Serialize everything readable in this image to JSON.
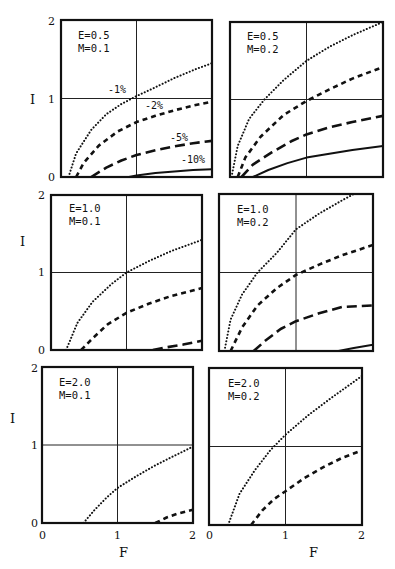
{
  "chart_data": [
    {
      "type": "line",
      "panel": "top-left",
      "annotation": [
        "E=0.5",
        "M=0.1"
      ],
      "xlabel": "",
      "ylabel": "I",
      "xlim": [
        0,
        2
      ],
      "ylim": [
        0,
        2
      ],
      "grid_lines": {
        "x": [
          1
        ],
        "y": [
          1
        ]
      },
      "yticks": [
        "0",
        "1",
        "2"
      ],
      "series": [
        {
          "name": "-1%",
          "style": "dotted",
          "x": [
            0.1,
            0.2,
            0.4,
            0.6,
            0.8,
            1.0,
            1.2,
            1.5,
            1.8,
            2.0
          ],
          "y": [
            0,
            0.3,
            0.6,
            0.8,
            0.93,
            1.03,
            1.12,
            1.26,
            1.38,
            1.45
          ]
        },
        {
          "name": "-2%",
          "style": "short-dash",
          "x": [
            0.2,
            0.3,
            0.5,
            0.75,
            1.0,
            1.25,
            1.5,
            1.75,
            2.0
          ],
          "y": [
            0,
            0.18,
            0.4,
            0.58,
            0.7,
            0.78,
            0.85,
            0.91,
            0.96
          ]
        },
        {
          "name": "-5%",
          "style": "long-dash",
          "x": [
            0.4,
            0.6,
            0.8,
            1.0,
            1.25,
            1.5,
            1.75,
            2.0
          ],
          "y": [
            0,
            0.12,
            0.21,
            0.28,
            0.34,
            0.39,
            0.43,
            0.46
          ]
        },
        {
          "name": "-10%",
          "style": "solid",
          "x": [
            0.9,
            1.0,
            1.25,
            1.5,
            1.75,
            2.0
          ],
          "y": [
            0,
            0.02,
            0.05,
            0.07,
            0.09,
            0.1
          ]
        }
      ],
      "curve_labels": [
        {
          "text": "-1%",
          "x": 0.72,
          "y": 1.08
        },
        {
          "text": "-2%",
          "x": 1.28,
          "y": 0.88
        },
        {
          "text": "-5%",
          "x": 1.52,
          "y": 0.52
        },
        {
          "text": "-10%",
          "x": 1.62,
          "y": 0.2
        }
      ]
    },
    {
      "type": "line",
      "panel": "top-right",
      "annotation": [
        "E=0.5",
        "M=0.2"
      ],
      "xlabel": "",
      "ylabel": "",
      "xlim": [
        0,
        2
      ],
      "ylim": [
        0,
        2
      ],
      "grid_lines": {
        "x": [
          1
        ],
        "y": [
          1
        ]
      },
      "series": [
        {
          "name": "-1%",
          "style": "dotted",
          "x": [
            0.02,
            0.1,
            0.25,
            0.45,
            0.7,
            1.0,
            1.3,
            1.6,
            2.0
          ],
          "y": [
            0,
            0.4,
            0.75,
            1.0,
            1.25,
            1.5,
            1.68,
            1.83,
            2.0
          ]
        },
        {
          "name": "-2%",
          "style": "short-dash",
          "x": [
            0.1,
            0.2,
            0.4,
            0.7,
            1.0,
            1.3,
            1.6,
            2.0
          ],
          "y": [
            0,
            0.25,
            0.52,
            0.8,
            0.98,
            1.13,
            1.27,
            1.42
          ]
        },
        {
          "name": "-5%",
          "style": "long-dash",
          "x": [
            0.15,
            0.3,
            0.55,
            0.8,
            1.0,
            1.3,
            1.6,
            2.0
          ],
          "y": [
            0,
            0.16,
            0.32,
            0.46,
            0.55,
            0.64,
            0.71,
            0.79
          ]
        },
        {
          "name": "-10%",
          "style": "solid",
          "x": [
            0.3,
            0.5,
            0.75,
            1.0,
            1.3,
            1.6,
            2.0
          ],
          "y": [
            0,
            0.09,
            0.18,
            0.25,
            0.3,
            0.35,
            0.4
          ]
        }
      ]
    },
    {
      "type": "line",
      "panel": "middle-left",
      "annotation": [
        "E=1.0",
        "M=0.1"
      ],
      "xlabel": "",
      "ylabel": "I",
      "xlim": [
        0,
        2
      ],
      "ylim": [
        0,
        2
      ],
      "grid_lines": {
        "x": [
          1
        ],
        "y": [
          1
        ]
      },
      "yticks": [
        "0",
        "1",
        "2"
      ],
      "series": [
        {
          "name": "-1%",
          "style": "dotted",
          "x": [
            0.2,
            0.35,
            0.55,
            0.8,
            1.0,
            1.3,
            1.6,
            2.0
          ],
          "y": [
            0,
            0.35,
            0.62,
            0.85,
            1.0,
            1.15,
            1.28,
            1.42
          ]
        },
        {
          "name": "-2%",
          "style": "short-dash",
          "x": [
            0.4,
            0.55,
            0.75,
            1.0,
            1.3,
            1.6,
            2.0
          ],
          "y": [
            0,
            0.15,
            0.33,
            0.48,
            0.6,
            0.7,
            0.8
          ]
        },
        {
          "name": "-5%",
          "style": "long-dash",
          "x": [
            1.35,
            1.5,
            1.75,
            2.0
          ],
          "y": [
            0,
            0.03,
            0.07,
            0.12
          ]
        }
      ]
    },
    {
      "type": "line",
      "panel": "middle-right",
      "annotation": [
        "E=1.0",
        "M=0.2"
      ],
      "xlabel": "",
      "ylabel": "",
      "xlim": [
        0,
        2
      ],
      "ylim": [
        0,
        2
      ],
      "grid_lines": {
        "x": [
          1
        ],
        "y": [
          1
        ]
      },
      "series": [
        {
          "name": "-1%",
          "style": "dotted",
          "x": [
            0.07,
            0.15,
            0.3,
            0.5,
            0.75,
            1.0,
            1.3,
            1.6,
            1.75
          ],
          "y": [
            0,
            0.4,
            0.72,
            1.0,
            1.25,
            1.55,
            1.75,
            1.92,
            2.0
          ]
        },
        {
          "name": "-2%",
          "style": "short-dash",
          "x": [
            0.15,
            0.3,
            0.5,
            0.75,
            1.0,
            1.3,
            1.6,
            2.0
          ],
          "y": [
            0,
            0.3,
            0.58,
            0.8,
            0.97,
            1.1,
            1.22,
            1.35
          ]
        },
        {
          "name": "-5%",
          "style": "long-dash",
          "x": [
            0.45,
            0.6,
            0.8,
            1.0,
            1.3,
            1.6,
            2.0
          ],
          "y": [
            0,
            0.13,
            0.28,
            0.38,
            0.48,
            0.56,
            0.58
          ]
        },
        {
          "name": "-10%",
          "style": "solid",
          "x": [
            1.55,
            1.75,
            2.0
          ],
          "y": [
            0,
            0.04,
            0.08
          ]
        }
      ]
    },
    {
      "type": "line",
      "panel": "bottom-left",
      "annotation": [
        "E=2.0",
        "M=0.1"
      ],
      "xlabel": "F",
      "ylabel": "I",
      "xlim": [
        0,
        2
      ],
      "ylim": [
        0,
        2
      ],
      "grid_lines": {
        "x": [
          1
        ],
        "y": [
          1
        ]
      },
      "xticks": [
        "0",
        "1",
        "2"
      ],
      "yticks": [
        "0",
        "1",
        "2"
      ],
      "series": [
        {
          "name": "-1%",
          "style": "dotted",
          "x": [
            0.55,
            0.7,
            0.85,
            1.0,
            1.25,
            1.5,
            1.75,
            2.0
          ],
          "y": [
            0,
            0.17,
            0.32,
            0.45,
            0.6,
            0.74,
            0.86,
            0.98
          ]
        },
        {
          "name": "-2%",
          "style": "short-dash",
          "x": [
            1.5,
            1.65,
            1.8,
            2.0
          ],
          "y": [
            0,
            0.07,
            0.12,
            0.17
          ]
        }
      ]
    },
    {
      "type": "line",
      "panel": "bottom-right",
      "annotation": [
        "E=2.0",
        "M=0.2"
      ],
      "xlabel": "F",
      "ylabel": "",
      "xlim": [
        0,
        2
      ],
      "ylim": [
        0,
        2
      ],
      "grid_lines": {
        "x": [
          1
        ],
        "y": [
          1
        ]
      },
      "xticks": [
        "0",
        "1",
        "2"
      ],
      "series": [
        {
          "name": "-1%",
          "style": "dotted",
          "x": [
            0.25,
            0.4,
            0.6,
            0.8,
            1.0,
            1.3,
            1.6,
            2.0
          ],
          "y": [
            0,
            0.4,
            0.7,
            0.95,
            1.15,
            1.4,
            1.62,
            1.9
          ]
        },
        {
          "name": "-2%",
          "style": "short-dash",
          "x": [
            0.55,
            0.7,
            0.85,
            1.0,
            1.25,
            1.5,
            1.75,
            2.0
          ],
          "y": [
            0,
            0.19,
            0.33,
            0.43,
            0.6,
            0.74,
            0.86,
            0.95
          ]
        }
      ]
    }
  ],
  "axis": {
    "ylabel": "I",
    "xlabel": "F",
    "tick_0": "0",
    "tick_1": "1",
    "tick_2": "2"
  },
  "panels": [
    {
      "E": "E=0.5",
      "M": "M=0.1"
    },
    {
      "E": "E=0.5",
      "M": "M=0.2"
    },
    {
      "E": "E=1.0",
      "M": "M=0.1"
    },
    {
      "E": "E=1.0",
      "M": "M=0.2"
    },
    {
      "E": "E=2.0",
      "M": "M=0.1"
    },
    {
      "E": "E=2.0",
      "M": "M=0.2"
    }
  ],
  "curve_labels": {
    "l1": "-1%",
    "l2": "-2%",
    "l5": "-5%",
    "l10": "-10%"
  }
}
